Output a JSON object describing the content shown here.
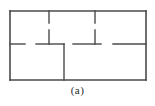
{
  "figure": {
    "caption": "(a)",
    "stroke_color": "#4a4a4a",
    "background_color": "#ffffff",
    "line_width_outer": 1.6,
    "line_width_inner": 1.4,
    "bounds": {
      "x": 10,
      "y": 11,
      "width": 136,
      "height": 69
    }
  },
  "plan": {
    "outer_wall": {
      "name": "outer-rectangle",
      "left": 10,
      "top": 11,
      "right": 146,
      "bottom": 80
    },
    "middle_wall_y": 44,
    "segments": [
      {
        "name": "middle-wall-left",
        "type": "horizontal",
        "x1": 10,
        "x2": 25,
        "y": 44
      },
      {
        "name": "middle-wall-center-left",
        "type": "horizontal",
        "x1": 36,
        "x2": 64,
        "y": 44
      },
      {
        "name": "middle-wall-center-right",
        "type": "horizontal",
        "x1": 73,
        "x2": 101,
        "y": 44
      },
      {
        "name": "middle-wall-right",
        "type": "horizontal",
        "x1": 113,
        "x2": 146,
        "y": 44
      },
      {
        "name": "top-stub-left",
        "type": "vertical",
        "x": 49,
        "y1": 11,
        "y2": 23
      },
      {
        "name": "top-stub-right",
        "type": "vertical",
        "x": 95,
        "y1": 11,
        "y2": 23
      },
      {
        "name": "upper-partition-left",
        "type": "vertical",
        "x": 49,
        "y1": 30,
        "y2": 44
      },
      {
        "name": "upper-partition-right",
        "type": "vertical",
        "x": 95,
        "y1": 30,
        "y2": 44
      },
      {
        "name": "center-partition-lower",
        "type": "vertical",
        "x": 64,
        "y1": 44,
        "y2": 80
      }
    ],
    "doorways": [
      {
        "name": "doorway-middle-left",
        "x1": 25,
        "x2": 36,
        "y": 44
      },
      {
        "name": "doorway-middle-mid",
        "x1": 64,
        "x2": 73,
        "y": 44
      },
      {
        "name": "doorway-middle-right",
        "x1": 101,
        "x2": 113,
        "y": 44
      },
      {
        "name": "doorway-upper-left",
        "x": 49,
        "y1": 23,
        "y2": 30
      },
      {
        "name": "doorway-upper-right",
        "x": 95,
        "y1": 23,
        "y2": 30
      }
    ]
  }
}
